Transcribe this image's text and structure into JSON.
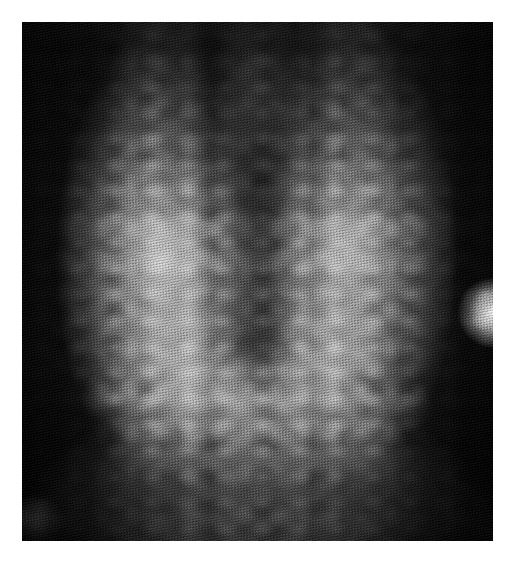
{
  "page": {
    "width": 519,
    "height": 578,
    "background_color": "#ffffff",
    "margin_color": "#ffffff"
  },
  "figure": {
    "kind": "radiograph",
    "alt_text": "Grayscale anteroposterior radiograph of the lower lumbar spine and sacrum",
    "plate": {
      "x": 22,
      "y": 22,
      "width": 471,
      "height": 519,
      "background_color": "#0a0a0a",
      "print_texture": "halftone-line-screen"
    },
    "regions": [
      {
        "name": "top-left-corner",
        "description": "near-black soft tissue shadow",
        "color": "#070707"
      },
      {
        "name": "top-right-corner",
        "description": "near-black soft tissue shadow",
        "color": "#060606"
      },
      {
        "name": "left-pedicle-column",
        "description": "bright vertical bony column left of midline",
        "color": "#d8d8d8"
      },
      {
        "name": "right-pedicle-column",
        "description": "bright vertical bony column right of midline",
        "color": "#cfcfcf"
      },
      {
        "name": "central-canal-channel",
        "description": "darker vertical midline channel in upper half",
        "color": "#2a2a2a"
      },
      {
        "name": "vertebral-body-mottling",
        "description": "mid-gray mottled trabecular bone centrally",
        "color": "#8a8a8a"
      },
      {
        "name": "sacrum-bright-mass",
        "description": "saturated white mass at lower centre",
        "color": "#ffffff"
      },
      {
        "name": "right-edge-flash",
        "description": "small bright white flare at right border, upper middle",
        "color": "#fdfdfd"
      },
      {
        "name": "bottom-left-corner",
        "description": "dark shadow",
        "color": "#0c0c0c"
      },
      {
        "name": "bottom-right-corner",
        "description": "dark shadow",
        "color": "#0c0c0c"
      }
    ]
  }
}
